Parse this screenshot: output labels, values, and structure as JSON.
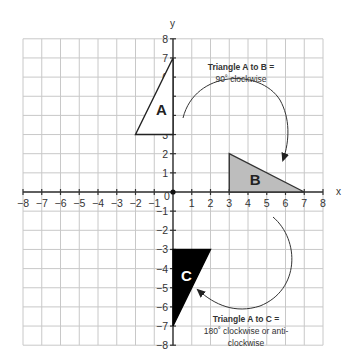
{
  "diagram": {
    "type": "coordinate-plane-rotation",
    "axes": {
      "x_label": "x",
      "y_label": "y",
      "x_range": [
        -8,
        8
      ],
      "y_range": [
        -8,
        8
      ],
      "x_ticks": [
        "-8",
        "-7",
        "-6",
        "-5",
        "-4",
        "-3",
        "-2",
        "-1",
        "1",
        "2",
        "3",
        "4",
        "5",
        "6",
        "7",
        "8"
      ],
      "y_ticks": [
        "8",
        "7",
        "6",
        "5",
        "4",
        "3",
        "2",
        "1",
        "-1",
        "-2",
        "-3",
        "-4",
        "-5",
        "-6",
        "-7",
        "-8"
      ],
      "origin_label": "0",
      "grid": true
    },
    "triangles": [
      {
        "label": "A",
        "vertices": [
          [
            0,
            3
          ],
          [
            0,
            7
          ],
          [
            -2,
            3
          ]
        ],
        "fill": "#ffffff",
        "stroke": "#222222",
        "label_color": "#222222"
      },
      {
        "label": "B",
        "vertices": [
          [
            3,
            0
          ],
          [
            3,
            2
          ],
          [
            7,
            0
          ]
        ],
        "fill": "#bdbdbd",
        "stroke": "#333333",
        "label_color": "#222222"
      },
      {
        "label": "C",
        "vertices": [
          [
            0,
            -3
          ],
          [
            2,
            -3
          ],
          [
            0,
            -7
          ]
        ],
        "fill": "#000000",
        "stroke": "#000000",
        "label_color": "#ffffff"
      }
    ],
    "annotations": [
      {
        "id": "a_to_b",
        "title": "Triangle A to B =",
        "lines": [
          "90˚ clockwise"
        ]
      },
      {
        "id": "a_to_c",
        "title": "Triangle A to C =",
        "lines": [
          "180˚ clockwise or anti-",
          "clockwise"
        ]
      }
    ]
  }
}
